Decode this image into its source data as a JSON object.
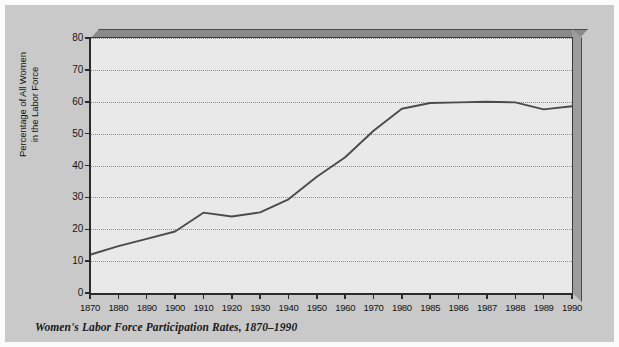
{
  "figure": {
    "caption": "Women's Labor Force Participation Rates, 1870–1990",
    "page_background": "#c9c9c9",
    "plot_background": "#e9e9e9",
    "line_color": "#4b4b4b",
    "axis_color": "#2b2b2b",
    "grid_color": "#8e8e8e"
  },
  "chart_data": {
    "type": "line",
    "title": "",
    "subtitle": "",
    "xlabel": "",
    "ylabel": "Percentage of All Women\nin the Labor Force",
    "ylabel_line1": "Percentage of All Women",
    "ylabel_line2": "in the Labor Force",
    "categories": [
      "1870",
      "1880",
      "1890",
      "1900",
      "1910",
      "1920",
      "1930",
      "1940",
      "1950",
      "1960",
      "1970",
      "1980",
      "1985",
      "1986",
      "1987",
      "1988",
      "1989",
      "1990"
    ],
    "values": [
      12.0,
      14.7,
      17.0,
      19.3,
      25.2,
      24.0,
      25.3,
      29.4,
      36.5,
      42.6,
      50.9,
      57.8,
      59.6,
      59.8,
      60.0,
      59.8,
      57.6,
      58.6
    ],
    "series": [
      {
        "name": "Percentage of All Women in the Labor Force",
        "values": [
          12.0,
          14.7,
          17.0,
          19.3,
          25.2,
          24.0,
          25.3,
          29.4,
          36.5,
          42.6,
          50.9,
          57.8,
          59.6,
          59.8,
          60.0,
          59.8,
          57.6,
          58.6
        ]
      }
    ],
    "y_ticks": [
      0,
      10,
      20,
      30,
      40,
      50,
      60,
      70,
      80
    ],
    "ylim": [
      0,
      80
    ],
    "xlim_labels": [
      "1870",
      "1990"
    ],
    "grid": "horizontal-dotted",
    "legend": "none",
    "annotations": []
  }
}
